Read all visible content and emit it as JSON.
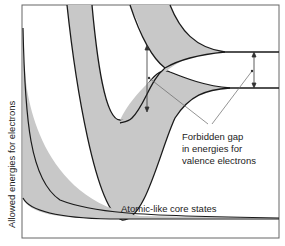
{
  "diagram": {
    "y_axis_label": "Allowed energies for electrons",
    "annotations": {
      "forbidden_gap": [
        "Forbidden gap",
        "in energies for",
        "valence electrons"
      ],
      "core_states": "Atomic-like core states"
    },
    "colors": {
      "band_fill": "#c8c8c8",
      "line": "#1a1a1a",
      "frame": "#555555",
      "leader": "#666666"
    }
  }
}
